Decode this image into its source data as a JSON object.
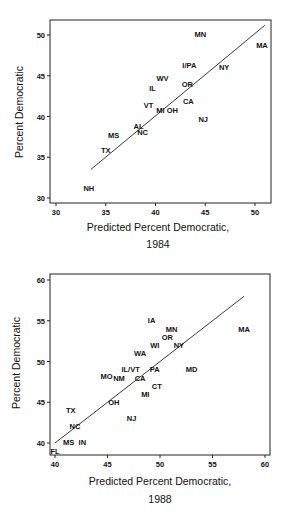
{
  "chart_data": [
    {
      "type": "scatter",
      "title": "",
      "xlabel": "Predicted Percent Democratic,",
      "xlabel_line2": "1984",
      "ylabel": "Percent Democratic",
      "xlim": [
        29,
        52
      ],
      "ylim": [
        29.5,
        52
      ],
      "xticks": [
        30,
        35,
        40,
        45,
        50
      ],
      "yticks": [
        30,
        35,
        40,
        45,
        50
      ],
      "grid": false,
      "legend": "none",
      "points": [
        {
          "label": "MN",
          "x": 44.5,
          "y": 50.1
        },
        {
          "label": "MA",
          "x": 50.7,
          "y": 48.7
        },
        {
          "label": "I/PA",
          "x": 43.4,
          "y": 46.3
        },
        {
          "label": "NY",
          "x": 46.9,
          "y": 46.0
        },
        {
          "label": "WV",
          "x": 40.7,
          "y": 44.7
        },
        {
          "label": "OR",
          "x": 43.2,
          "y": 44.0
        },
        {
          "label": "IL",
          "x": 39.7,
          "y": 43.5
        },
        {
          "label": "CA",
          "x": 43.3,
          "y": 41.9
        },
        {
          "label": "VT",
          "x": 39.3,
          "y": 41.4
        },
        {
          "label": "MI",
          "x": 40.5,
          "y": 40.7
        },
        {
          "label": "OH",
          "x": 41.7,
          "y": 40.7
        },
        {
          "label": "NJ",
          "x": 44.8,
          "y": 39.7
        },
        {
          "label": "AL",
          "x": 38.3,
          "y": 38.8
        },
        {
          "label": "NC",
          "x": 38.7,
          "y": 38.1
        },
        {
          "label": "MS",
          "x": 35.8,
          "y": 37.7
        },
        {
          "label": "TX",
          "x": 35.0,
          "y": 35.9
        },
        {
          "label": "NH",
          "x": 33.3,
          "y": 31.2
        }
      ],
      "fit_line": {
        "x": [
          33.5,
          51.0
        ],
        "y": [
          33.5,
          51.2
        ]
      }
    },
    {
      "type": "scatter",
      "title": "",
      "xlabel": "Predicted Percent Democratic,",
      "xlabel_line2": "1988",
      "ylabel": "Percent Democratic",
      "xlim": [
        39.7,
        60.4
      ],
      "ylim": [
        38.3,
        60.8
      ],
      "xticks": [
        40,
        45,
        50,
        55,
        60
      ],
      "yticks": [
        40,
        45,
        50,
        55,
        60
      ],
      "grid": false,
      "legend": "none",
      "points": [
        {
          "label": "IA",
          "x": 49.2,
          "y": 55.0
        },
        {
          "label": "MN",
          "x": 51.1,
          "y": 54.0
        },
        {
          "label": "MA",
          "x": 58.0,
          "y": 54.0
        },
        {
          "label": "OR",
          "x": 50.7,
          "y": 53.0
        },
        {
          "label": "WI",
          "x": 49.5,
          "y": 52.0
        },
        {
          "label": "NY",
          "x": 51.8,
          "y": 52.0
        },
        {
          "label": "WA",
          "x": 48.1,
          "y": 51.0
        },
        {
          "label": "IL/VT",
          "x": 47.2,
          "y": 49.0
        },
        {
          "label": "PA",
          "x": 49.5,
          "y": 49.0
        },
        {
          "label": "MD",
          "x": 53.0,
          "y": 49.0
        },
        {
          "label": "MO",
          "x": 44.9,
          "y": 48.2
        },
        {
          "label": "NM",
          "x": 46.1,
          "y": 48.0
        },
        {
          "label": "CA",
          "x": 48.1,
          "y": 48.0
        },
        {
          "label": "CT",
          "x": 49.7,
          "y": 47.0
        },
        {
          "label": "MI",
          "x": 48.6,
          "y": 46.0
        },
        {
          "label": "OH",
          "x": 45.6,
          "y": 45.0
        },
        {
          "label": "TX",
          "x": 41.5,
          "y": 44.0
        },
        {
          "label": "NJ",
          "x": 47.3,
          "y": 43.0
        },
        {
          "label": "NC",
          "x": 41.9,
          "y": 42.0
        },
        {
          "label": "MS",
          "x": 41.3,
          "y": 40.1
        },
        {
          "label": "IN",
          "x": 42.6,
          "y": 40.1
        },
        {
          "label": "FL",
          "x": 40.0,
          "y": 39.0
        }
      ],
      "fit_line": {
        "x": [
          40.0,
          58.0
        ],
        "y": [
          40.0,
          58.0
        ]
      }
    }
  ],
  "layout": [
    {
      "frame": {
        "left": 50,
        "top": 20,
        "right": 271,
        "bottom": 203
      },
      "xmap": {
        "v0": 30,
        "p0": 56,
        "v1": 50,
        "p1": 255
      },
      "ymap": {
        "v0": 30,
        "p0": 198,
        "v1": 50,
        "p1": 35
      }
    },
    {
      "frame": {
        "left": 50,
        "top": 14,
        "right": 270,
        "bottom": 195
      },
      "xmap": {
        "v0": 40,
        "p0": 55,
        "v1": 60,
        "p1": 265
      },
      "ymap": {
        "v0": 40,
        "p0": 183,
        "v1": 60,
        "p1": 20
      }
    }
  ]
}
